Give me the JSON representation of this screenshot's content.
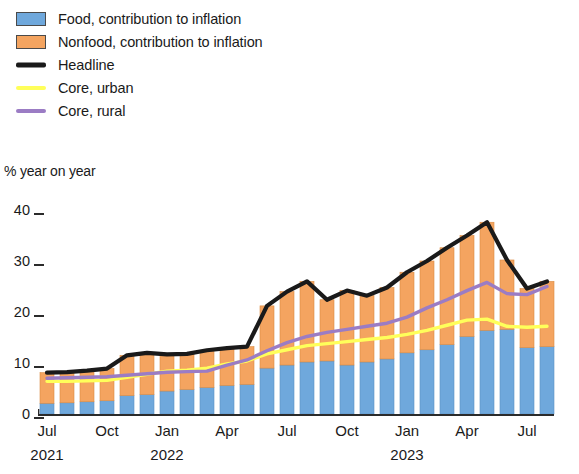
{
  "legend": {
    "items": [
      {
        "label": "Food, contribution to inflation",
        "type": "swatch",
        "color": "#6fa8dc",
        "name": "legend-food"
      },
      {
        "label": "Nonfood, contribution to inflation",
        "type": "swatch",
        "color": "#f4a460",
        "name": "legend-nonfood"
      },
      {
        "label": "Headline",
        "type": "line",
        "color": "#1a1a1a",
        "name": "legend-headline"
      },
      {
        "label": "Core, urban",
        "type": "line",
        "color": "#ffff5a",
        "name": "legend-core-urban"
      },
      {
        "label": "Core, rural",
        "type": "line",
        "color": "#9b7cc4",
        "name": "legend-core-rural"
      }
    ]
  },
  "axis": {
    "y_title": "% year on year",
    "y_ticks": [
      "40",
      "30",
      "20",
      "10",
      "0"
    ],
    "x_labels": [
      {
        "month": "Jul",
        "year": "2021",
        "index": 0
      },
      {
        "month": "Oct",
        "year": "",
        "index": 3
      },
      {
        "month": "Jan",
        "year": "2022",
        "index": 6
      },
      {
        "month": "Apr",
        "year": "",
        "index": 9
      },
      {
        "month": "Jul",
        "year": "",
        "index": 12
      },
      {
        "month": "Oct",
        "year": "",
        "index": 15
      },
      {
        "month": "Jan",
        "year": "2023",
        "index": 18
      },
      {
        "month": "Apr",
        "year": "",
        "index": 21
      },
      {
        "month": "Jul",
        "year": "",
        "index": 24
      }
    ]
  },
  "chart_data": {
    "type": "bar",
    "title": "",
    "subtitle": "",
    "xlabel": "",
    "ylabel": "% year on year",
    "ylim": [
      0,
      40
    ],
    "yticks": [
      0,
      10,
      20,
      30,
      40
    ],
    "grid": false,
    "legend_position": "top-left",
    "stacked": true,
    "categories": [
      "Jul 2021",
      "Aug 2021",
      "Sep 2021",
      "Oct 2021",
      "Nov 2021",
      "Dec 2021",
      "Jan 2022",
      "Feb 2022",
      "Mar 2022",
      "Apr 2022",
      "May 2022",
      "Jun 2022",
      "Jul 2022",
      "Aug 2022",
      "Sep 2022",
      "Oct 2022",
      "Nov 2022",
      "Dec 2022",
      "Jan 2023",
      "Feb 2023",
      "Mar 2023",
      "Apr 2023",
      "May 2023",
      "Jun 2023",
      "Jul 2023",
      "Aug 2023"
    ],
    "series": [
      {
        "name": "Food, contribution to inflation",
        "color": "#6fa8dc",
        "type": "bar",
        "values": [
          2.1,
          2.2,
          2.4,
          2.6,
          3.6,
          3.8,
          4.5,
          4.8,
          5.2,
          5.6,
          5.8,
          9.0,
          9.6,
          10.2,
          10.4,
          9.6,
          10.2,
          10.8,
          12.0,
          12.6,
          13.6,
          15.2,
          16.4,
          16.6,
          13.0,
          13.2
        ]
      },
      {
        "name": "Nonfood, contribution to inflation",
        "color": "#f4a460",
        "type": "bar",
        "values": [
          6.0,
          6.0,
          6.1,
          6.3,
          7.9,
          8.2,
          7.2,
          7.0,
          7.3,
          7.3,
          7.4,
          12.2,
          14.4,
          15.8,
          12.0,
          14.6,
          13.0,
          14.0,
          15.8,
          17.4,
          19.0,
          19.8,
          21.2,
          13.6,
          11.6,
          12.8
        ]
      }
    ],
    "lines": [
      {
        "name": "Headline",
        "color": "#1a1a1a",
        "type": "line",
        "values": [
          8.1,
          8.2,
          8.5,
          8.9,
          11.5,
          12.0,
          11.7,
          11.8,
          12.5,
          12.9,
          13.2,
          21.2,
          24.0,
          26.0,
          22.4,
          24.2,
          23.2,
          24.8,
          27.8,
          30.0,
          32.6,
          35.0,
          37.6,
          30.2,
          24.6,
          26.0
        ]
      },
      {
        "name": "Core, urban",
        "color": "#ffff5a",
        "type": "line",
        "values": [
          6.4,
          6.4,
          6.5,
          6.6,
          7.2,
          7.8,
          8.4,
          8.6,
          9.0,
          9.8,
          10.4,
          11.8,
          12.6,
          13.4,
          13.8,
          14.2,
          14.6,
          15.0,
          15.6,
          16.4,
          17.4,
          18.4,
          18.6,
          17.2,
          17.0,
          17.2
        ]
      },
      {
        "name": "Core, rural",
        "color": "#9b7cc4",
        "type": "line",
        "values": [
          7.0,
          7.1,
          7.2,
          7.3,
          7.6,
          7.9,
          8.2,
          8.3,
          8.4,
          9.6,
          10.6,
          12.4,
          14.0,
          15.2,
          16.0,
          16.6,
          17.2,
          17.8,
          19.0,
          20.8,
          22.4,
          24.2,
          25.8,
          23.6,
          23.4,
          25.0
        ]
      }
    ]
  }
}
